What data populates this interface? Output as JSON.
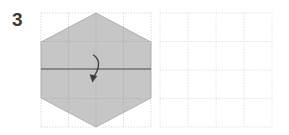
{
  "diagram": {
    "type": "origami-fold-instruction",
    "step_label": "3",
    "background_color": "#ffffff",
    "panels": [
      {
        "name": "before-panel",
        "role": "current-state",
        "grid": {
          "x": 41,
          "y": 13,
          "width": 110,
          "height": 114,
          "columns": 4,
          "rows": 4,
          "line_style": "dotted",
          "line_color": "#c9c9c9"
        },
        "shape": {
          "name": "hexagon",
          "fill_color": "#c6c6c6",
          "stroke_color": "#9a9a9a",
          "points": "96,13 151,42 151,98 96,127 41,98 41,42"
        },
        "fold_line": {
          "name": "horizontal-fold-line",
          "color": "#4a4a4a",
          "x1": 41,
          "y1": 69,
          "x2": 151,
          "y2": 69
        },
        "arrow": {
          "name": "fold-arrow",
          "color": "#3c3c3c",
          "direction": "fold-top-half-down",
          "path": "M 93.5,55 C 100,59 99.5,68 93,77",
          "head_points": "93.2,82.2 90.3,74.4 97.4,76.1"
        }
      },
      {
        "name": "after-panel",
        "role": "result-state",
        "grid": {
          "x": 160,
          "y": 13,
          "width": 112,
          "height": 114,
          "columns": 4,
          "rows": 4,
          "line_style": "dotted",
          "line_color": "#d4d4d4"
        },
        "shape": null,
        "fold_line": null,
        "arrow": null
      }
    ]
  }
}
